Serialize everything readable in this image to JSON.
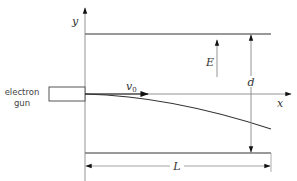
{
  "diagram": {
    "labels": {
      "y_axis": "y",
      "x_axis": "x",
      "field": "E",
      "plate_separation": "d",
      "velocity": "v",
      "velocity_subscript": "0",
      "length": "L",
      "gun_line1": "electron",
      "gun_line2": "gun"
    },
    "colors": {
      "line": "#555555",
      "plate": "#777777",
      "trajectory": "#333333",
      "arrowhead": "#111111"
    }
  }
}
